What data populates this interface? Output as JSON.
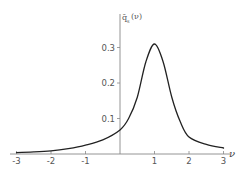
{
  "chart_data": {
    "type": "line",
    "title": "",
    "xlabel": "ν",
    "ylabel": "q̄ₛ(ν)",
    "xlim": [
      -3,
      3
    ],
    "ylim": [
      0,
      0.35
    ],
    "grid": false,
    "legend": null,
    "x_ticks": [
      "-3",
      "-2",
      "-1",
      "1",
      "2",
      "3"
    ],
    "y_ticks": [
      "0.1",
      "0.2",
      "0.3"
    ],
    "series": [
      {
        "name": "q̄ₛ(ν)",
        "x": [
          -3,
          -2.5,
          -2,
          -1.5,
          -1,
          -0.5,
          0,
          0.25,
          0.5,
          0.75,
          1,
          1.25,
          1.5,
          1.75,
          2,
          2.5,
          3
        ],
        "y": [
          0.004,
          0.006,
          0.009,
          0.015,
          0.025,
          0.04,
          0.068,
          0.1,
          0.16,
          0.26,
          0.31,
          0.26,
          0.16,
          0.09,
          0.048,
          0.027,
          0.017
        ]
      }
    ],
    "peak": {
      "x": 1,
      "y": 0.31
    }
  },
  "labels": {
    "y_axis_main": "q̄",
    "y_axis_sub": "s",
    "y_axis_arg": "(ν)",
    "x_axis": "ν",
    "x_tick_labels": [
      "-3",
      "-2",
      "-1",
      "1",
      "2",
      "3"
    ],
    "y_tick_labels": [
      "0.1",
      "0.2",
      "0.3"
    ]
  },
  "colors": {
    "axis": "#888888",
    "curve": "#222222",
    "text": "#555555"
  }
}
